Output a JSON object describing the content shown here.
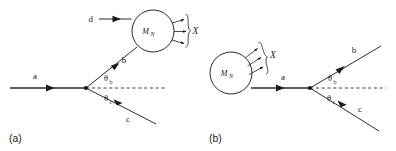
{
  "figure": {
    "background_color": "#ffffff",
    "line_color": "#2b2b2b",
    "text_color": "#1a1a1a"
  },
  "panel_a": {
    "id": "(a)",
    "label": "(a)",
    "blob_label": "M",
    "blob_sublabel": "N",
    "particles": {
      "a": "a",
      "b": "b",
      "c": "c",
      "d": "d",
      "x": "X"
    },
    "angles": {
      "theta_b": "θ",
      "theta_b_sub": "b",
      "theta_c": "θ",
      "theta_c_sub": "c"
    },
    "outgoing_x_count": 3
  },
  "panel_b": {
    "id": "(b)",
    "label": "(b)",
    "blob_label": "M",
    "blob_sublabel": "N",
    "particles": {
      "a": "a",
      "b": "b",
      "c": "c",
      "x": "X"
    },
    "angles": {
      "theta_b": "θ",
      "theta_b_sub": "b",
      "theta_c": "θ",
      "theta_c_sub": "c"
    },
    "outgoing_x_count": 3
  }
}
